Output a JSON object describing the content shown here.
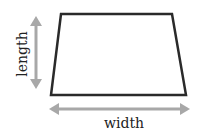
{
  "diagram": {
    "shape": "trapezoid",
    "labels": {
      "length": "length",
      "width": "width"
    },
    "colors": {
      "outline": "#2a2a2a",
      "arrow": "#a8a8a8",
      "text": "#222222",
      "background": "#ffffff"
    }
  }
}
